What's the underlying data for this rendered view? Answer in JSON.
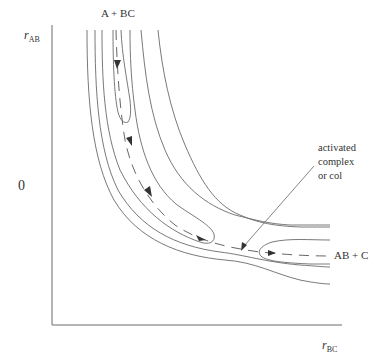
{
  "diagram": {
    "type": "potential-energy-surface-contour",
    "axes": {
      "y_label_main": "r",
      "y_label_sub": "AB",
      "x_label_main": "r",
      "x_label_sub": "BC",
      "origin_label": "0"
    },
    "labels": {
      "reactants": "A + BC",
      "products": "AB + C",
      "annotation_line1": "activated",
      "annotation_line2": "complex",
      "annotation_line3": "or col"
    },
    "colors": {
      "line": "#6a6a6a",
      "text": "#333333",
      "background": "#ffffff"
    }
  }
}
